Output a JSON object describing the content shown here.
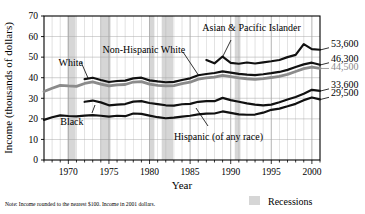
{
  "chart_data": {
    "type": "line",
    "title": "",
    "xlabel": "Year",
    "ylabel": "Income (thousands of dollars)",
    "ylim": [
      0,
      70
    ],
    "xlim": [
      1967,
      2001
    ],
    "yticks": [
      0,
      10,
      20,
      30,
      40,
      50,
      60,
      70
    ],
    "ytick_labels": [
      "0",
      "10",
      "20",
      "30",
      "40",
      "50",
      "60",
      "70"
    ],
    "xticks": [
      1970,
      1975,
      1980,
      1985,
      1990,
      1995,
      2000
    ],
    "xtick_labels": [
      "1970",
      "1975",
      "1980",
      "1985",
      "1990",
      "1995",
      "2000"
    ],
    "grid": true,
    "legend_position": "inline-annotations",
    "units": "thousands of 2001 dollars",
    "series": [
      {
        "name": "Asian & Pacific Islander",
        "color": "#111111",
        "width": 2.2,
        "label_x": 1986.5,
        "label_y": 62.5,
        "end_value_label": "53,600",
        "x": [
          1987,
          1988,
          1989,
          1990,
          1991,
          1992,
          1993,
          1994,
          1995,
          1996,
          1997,
          1998,
          1999,
          2000,
          2001
        ],
        "values": [
          48.6,
          47.0,
          50.3,
          47.2,
          46.8,
          47.4,
          46.9,
          47.5,
          48.0,
          48.6,
          50.0,
          51.1,
          56.3,
          53.9,
          53.6
        ]
      },
      {
        "name": "Non-Hispanic White",
        "color": "#111111",
        "width": 2.2,
        "label_x": 1974.2,
        "label_y": 52.0,
        "end_value_label": "46,300",
        "x": [
          1972,
          1973,
          1974,
          1975,
          1976,
          1977,
          1978,
          1979,
          1980,
          1981,
          1982,
          1983,
          1984,
          1985,
          1986,
          1987,
          1988,
          1989,
          1990,
          1991,
          1992,
          1993,
          1994,
          1995,
          1996,
          1997,
          1998,
          1999,
          2000,
          2001
        ],
        "values": [
          39.3,
          40.0,
          38.9,
          37.9,
          38.4,
          38.6,
          39.7,
          40.0,
          38.7,
          38.2,
          37.8,
          38.0,
          38.9,
          39.7,
          41.2,
          41.8,
          42.3,
          43.1,
          42.5,
          41.9,
          41.5,
          41.3,
          41.7,
          42.2,
          42.8,
          43.8,
          45.2,
          46.5,
          47.3,
          46.3
        ]
      },
      {
        "name": "White",
        "color": "#8b8b8b",
        "width": 2.8,
        "label_x": 1968.8,
        "label_y": 45.5,
        "end_value_label": "44,500",
        "x": [
          1967,
          1968,
          1969,
          1970,
          1971,
          1972,
          1973,
          1974,
          1975,
          1976,
          1977,
          1978,
          1979,
          1980,
          1981,
          1982,
          1983,
          1984,
          1985,
          1986,
          1987,
          1988,
          1989,
          1990,
          1991,
          1992,
          1993,
          1994,
          1995,
          1996,
          1997,
          1998,
          1999,
          2000,
          2001
        ],
        "values": [
          33.3,
          34.9,
          36.3,
          36.0,
          35.8,
          37.2,
          38.0,
          36.9,
          36.0,
          36.5,
          36.7,
          37.9,
          38.1,
          36.9,
          36.3,
          36.0,
          36.2,
          37.1,
          37.8,
          39.3,
          39.9,
          40.3,
          41.1,
          40.5,
          39.9,
          39.5,
          39.2,
          39.6,
          40.1,
          40.7,
          41.6,
          43.0,
          44.4,
          45.2,
          44.5
        ]
      },
      {
        "name": "Black",
        "color": "#111111",
        "width": 2.2,
        "label_x": 1969.0,
        "label_y": 17.2,
        "end_value_label": "29,500",
        "x": [
          1967,
          1968,
          1969,
          1970,
          1971,
          1972,
          1973,
          1974,
          1975,
          1976,
          1977,
          1978,
          1979,
          1980,
          1981,
          1982,
          1983,
          1984,
          1985,
          1986,
          1987,
          1988,
          1989,
          1990,
          1991,
          1992,
          1993,
          1994,
          1995,
          1996,
          1997,
          1998,
          1999,
          2000,
          2001
        ],
        "values": [
          19.5,
          20.8,
          21.7,
          21.4,
          21.2,
          21.6,
          21.8,
          21.5,
          21.1,
          21.5,
          21.3,
          22.6,
          22.4,
          21.6,
          20.8,
          20.3,
          20.6,
          21.1,
          21.5,
          22.2,
          22.5,
          22.6,
          23.6,
          22.9,
          22.2,
          22.0,
          22.1,
          23.0,
          24.4,
          25.0,
          26.1,
          27.3,
          29.1,
          30.4,
          29.5
        ]
      },
      {
        "name": "Hispanic (of any race)",
        "color": "#111111",
        "width": 2.2,
        "label_x": 1983.0,
        "label_y": 9.5,
        "end_value_label": "33,600",
        "x": [
          1972,
          1973,
          1974,
          1975,
          1976,
          1977,
          1978,
          1979,
          1980,
          1981,
          1982,
          1983,
          1984,
          1985,
          1986,
          1987,
          1988,
          1989,
          1990,
          1991,
          1992,
          1993,
          1994,
          1995,
          1996,
          1997,
          1998,
          1999,
          2000,
          2001
        ],
        "values": [
          28.3,
          28.9,
          28.0,
          26.6,
          26.9,
          27.2,
          28.4,
          28.6,
          27.7,
          27.2,
          26.6,
          26.4,
          27.1,
          27.3,
          28.3,
          28.6,
          28.6,
          30.2,
          29.1,
          28.3,
          27.5,
          26.9,
          26.6,
          26.9,
          28.1,
          29.4,
          30.6,
          32.2,
          34.1,
          33.6
        ]
      }
    ],
    "end_labels": [
      {
        "text": "53,600",
        "value": 53.6,
        "color": "dark"
      },
      {
        "text": "46,300",
        "value": 46.3,
        "color": "dark"
      },
      {
        "text": "44,500",
        "value": 44.5,
        "color": "grey"
      },
      {
        "text": "33,600",
        "value": 33.6,
        "color": "dark"
      },
      {
        "text": "29,500",
        "value": 29.5,
        "color": "dark"
      }
    ],
    "recessions": [
      {
        "start": 1969.9,
        "end": 1970.9
      },
      {
        "start": 1973.9,
        "end": 1975.2
      },
      {
        "start": 1980.0,
        "end": 1980.6
      },
      {
        "start": 1981.5,
        "end": 1982.9
      },
      {
        "start": 1990.5,
        "end": 1991.2
      },
      {
        "start": 2001.2,
        "end": 2001.9
      }
    ],
    "recession_color": "#d6d6d6",
    "gridline_color": "#a8a8a8",
    "axis_color": "#000000"
  },
  "footer": {
    "note": "Note: Income rounded to the nearest $100. Income in 2001 dollars.",
    "legend_label": "Recessions"
  },
  "partial_title": ""
}
